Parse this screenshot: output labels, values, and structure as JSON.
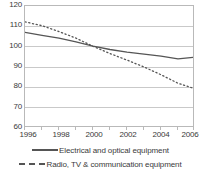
{
  "chart_data": {
    "type": "line",
    "title": "",
    "subtitle": "",
    "xlabel": "",
    "ylabel": "",
    "xlim": [
      1996,
      2006
    ],
    "ylim": [
      60,
      120
    ],
    "grid": true,
    "legend_position": "bottom",
    "y_ticks": [
      120,
      110,
      100,
      90,
      80,
      70,
      60
    ],
    "x_ticks": [
      1996,
      1998,
      2000,
      2002,
      2004,
      2006
    ],
    "x": [
      1996,
      1997,
      1998,
      1999,
      2000,
      2001,
      2002,
      2003,
      2004,
      2005,
      2006
    ],
    "series": [
      {
        "name": "Electrical and optical equipment",
        "style": "solid",
        "color": "#555555",
        "values": [
          107.0,
          105.6,
          104.2,
          102.4,
          100.3,
          98.6,
          97.3,
          96.3,
          95.3,
          94.0,
          94.8
        ]
      },
      {
        "name": "Radio, TV & communication equipment",
        "style": "dotted",
        "color": "#555555",
        "values": [
          112.2,
          110.3,
          107.4,
          104.2,
          100.2,
          96.6,
          93.4,
          90.0,
          86.2,
          82.0,
          79.3
        ]
      }
    ],
    "legend": [
      {
        "label": "Electrical and optical equipment",
        "style": "solid"
      },
      {
        "label": "Radio, TV & communication equipment",
        "style": "dotted"
      }
    ],
    "axis_color": "#b9b9b9",
    "grid_color": "#c9c9c9",
    "text_color": "#3a3a3a"
  }
}
